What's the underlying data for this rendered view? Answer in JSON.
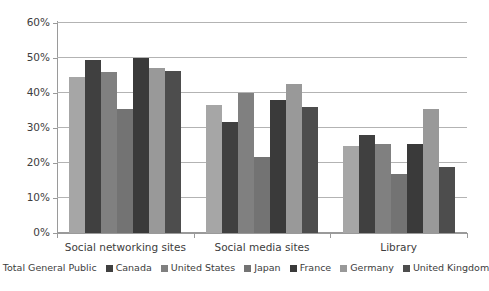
{
  "chart_data": {
    "type": "bar",
    "title": "",
    "subtitle": "",
    "xlabel": "",
    "ylabel": "",
    "categories": [
      "Social networking sites",
      "Social media sites",
      "Library"
    ],
    "ylim": [
      0,
      60
    ],
    "yticks": [
      0,
      10,
      20,
      30,
      40,
      50,
      60
    ],
    "ytick_labels": [
      "0%",
      "10%",
      "20%",
      "30%",
      "40%",
      "50%",
      "60%"
    ],
    "grid": "horizontal",
    "legend_position": "bottom",
    "value_suffix": "%",
    "series": [
      {
        "name": "Total General Public",
        "color": "#a6a6a6",
        "values": [
          44.7,
          36.5,
          25.0
        ]
      },
      {
        "name": "Canada",
        "color": "#404040",
        "values": [
          49.5,
          31.6,
          28.0
        ]
      },
      {
        "name": "United States",
        "color": "#808080",
        "values": [
          46.0,
          40.0,
          25.5
        ]
      },
      {
        "name": "Japan",
        "color": "#737373",
        "values": [
          35.4,
          21.6,
          17.0
        ]
      },
      {
        "name": "France",
        "color": "#3a3a3a",
        "values": [
          50.0,
          38.0,
          25.4
        ]
      },
      {
        "name": "Germany",
        "color": "#999999",
        "values": [
          47.2,
          42.5,
          35.5
        ]
      },
      {
        "name": "United Kingdom",
        "color": "#4d4d4d",
        "values": [
          46.4,
          36.0,
          19.0
        ]
      }
    ]
  }
}
